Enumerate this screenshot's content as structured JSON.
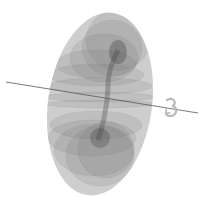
{
  "figure": {
    "type": "3d-torus-sweep",
    "background": "#ffffff",
    "surface_color": "#7a7a7a",
    "surface_opacity": 0.22,
    "axis": {
      "color": "#555555",
      "start": [
        6,
        82
      ],
      "end": [
        198,
        113
      ]
    },
    "rotation_indicator": {
      "icon": "curved-rotation-arrow-icon",
      "color": "#b8b8b8",
      "position": [
        171,
        108
      ]
    },
    "torus": {
      "center": [
        100,
        104
      ],
      "outer_rx": 53,
      "outer_ry": 92,
      "tilt_deg": 8
    }
  }
}
